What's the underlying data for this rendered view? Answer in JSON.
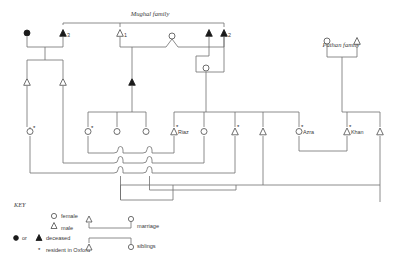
{
  "figure": {
    "family_labels": [
      {
        "id": "mughal",
        "text": "Mughal family",
        "x": 150,
        "y": 16
      },
      {
        "id": "pathan",
        "text": "Pathan family",
        "x": 341,
        "y": 47
      }
    ],
    "person_labels": [
      {
        "id": "g1-male-3",
        "text": "3",
        "x": 67,
        "y": 37
      },
      {
        "id": "g1-male-1",
        "text": "1",
        "x": 124,
        "y": 37
      },
      {
        "id": "g1-male-2",
        "text": "2",
        "x": 228,
        "y": 37
      },
      {
        "id": "riaz",
        "text": "Riaz",
        "x": 178,
        "y": 133
      },
      {
        "id": "azra",
        "text": "Azra",
        "x": 303,
        "y": 133
      },
      {
        "id": "khan",
        "text": "Khan",
        "x": 351,
        "y": 133
      }
    ],
    "key": {
      "title": "KEY",
      "entries": [
        {
          "id": "female",
          "symbol": "circle-open",
          "label": "female"
        },
        {
          "id": "male",
          "symbol": "triangle-open",
          "label": "male"
        },
        {
          "id": "deceased",
          "symbol": "filled",
          "prefix": "or",
          "label": "deceased"
        },
        {
          "id": "oxford",
          "symbol": "asterisk",
          "label": "resident in Oxford"
        }
      ],
      "relations": [
        {
          "id": "marriage",
          "label": "marriage"
        },
        {
          "id": "siblings",
          "label": "siblings"
        }
      ]
    },
    "colors": {
      "line": "#6e6e6e",
      "symbol_stroke": "#4a4a4a",
      "filled": "#1a1a1a",
      "text": "#3a3a3a",
      "background": "#ffffff"
    },
    "people": [
      {
        "id": "p-g1-f-deceased",
        "type": "female",
        "deceased": true,
        "oxford": false,
        "x": 27,
        "y": 33
      },
      {
        "id": "p-g1-m3",
        "type": "male",
        "deceased": true,
        "oxford": false,
        "x": 63,
        "y": 33
      },
      {
        "id": "p-g1-m1",
        "type": "male",
        "deceased": false,
        "oxford": false,
        "x": 120,
        "y": 33
      },
      {
        "id": "p-g1-f-mid",
        "type": "female",
        "deceased": false,
        "oxford": false,
        "x": 172,
        "y": 35
      },
      {
        "id": "p-g1-m-unnum",
        "type": "male",
        "deceased": true,
        "oxford": false,
        "x": 209,
        "y": 33
      },
      {
        "id": "p-g1-m2",
        "type": "male",
        "deceased": true,
        "oxford": false,
        "x": 224,
        "y": 33
      },
      {
        "id": "p-pathan-f",
        "type": "female",
        "deceased": false,
        "oxford": false,
        "x": 327,
        "y": 40
      },
      {
        "id": "p-pathan-m",
        "type": "male",
        "deceased": false,
        "oxford": false,
        "x": 357,
        "y": 40
      },
      {
        "id": "p-g2-m-a",
        "type": "male",
        "deceased": false,
        "oxford": false,
        "x": 27,
        "y": 82
      },
      {
        "id": "p-g2-m-b",
        "type": "male",
        "deceased": false,
        "oxford": false,
        "x": 63,
        "y": 82
      },
      {
        "id": "p-g2-m-c",
        "type": "male",
        "deceased": true,
        "oxford": false,
        "x": 132,
        "y": 82
      },
      {
        "id": "p-g2-f-d",
        "type": "female",
        "deceased": false,
        "oxford": false,
        "x": 206,
        "y": 68
      },
      {
        "id": "p-g3-f-1",
        "type": "female",
        "deceased": false,
        "oxford": true,
        "x": 30,
        "y": 131
      },
      {
        "id": "p-g3-f-2",
        "type": "female",
        "deceased": false,
        "oxford": true,
        "x": 88,
        "y": 131
      },
      {
        "id": "p-g3-f-3",
        "type": "female",
        "deceased": false,
        "oxford": false,
        "x": 117,
        "y": 131
      },
      {
        "id": "p-g3-f-4",
        "type": "female",
        "deceased": false,
        "oxford": false,
        "x": 146,
        "y": 131
      },
      {
        "id": "p-g3-m-riaz",
        "type": "male",
        "deceased": false,
        "oxford": true,
        "x": 174,
        "y": 131
      },
      {
        "id": "p-g3-f-5",
        "type": "female",
        "deceased": false,
        "oxford": false,
        "x": 204,
        "y": 131
      },
      {
        "id": "p-g3-m-6",
        "type": "male",
        "deceased": false,
        "oxford": true,
        "x": 235,
        "y": 131
      },
      {
        "id": "p-g3-m-7",
        "type": "male",
        "deceased": false,
        "oxford": false,
        "x": 263,
        "y": 131
      },
      {
        "id": "p-g3-f-azra",
        "type": "female",
        "deceased": false,
        "oxford": true,
        "x": 299,
        "y": 131
      },
      {
        "id": "p-g3-m-khan",
        "type": "male",
        "deceased": false,
        "oxford": true,
        "x": 347,
        "y": 131
      },
      {
        "id": "p-g3-m-8",
        "type": "male",
        "deceased": false,
        "oxford": false,
        "x": 380,
        "y": 131
      }
    ]
  }
}
